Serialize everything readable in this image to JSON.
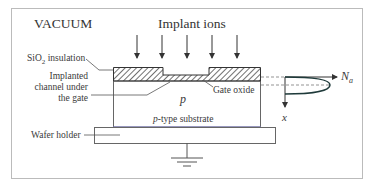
{
  "diagram": {
    "title_left": "VACUUM",
    "title_top": "Implant ions",
    "labels": {
      "sio2_prefix": "SiO",
      "sio2_sub": "2",
      "sio2_suffix": " insulation",
      "channel_line1": "Implanted",
      "channel_line2": "channel under",
      "channel_line3": "the gate",
      "gate_oxide": "Gate oxide",
      "p_region": "p",
      "substrate_italic": "p",
      "substrate_rest": "-type substrate",
      "wafer_holder": "Wafer holder",
      "axis_na": "N",
      "axis_na_sub": "a",
      "axis_x": "x"
    },
    "arrow_count": 6,
    "colors": {
      "line": "#555555",
      "frame": "#bbbbbb",
      "profile": "#1f3a3a",
      "substrate_top": "#7c7cc8"
    }
  }
}
